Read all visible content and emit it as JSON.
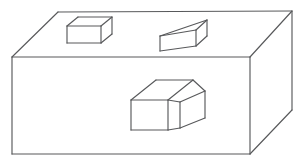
{
  "figure": {
    "background_color": "#ffffff",
    "line_color": "#58595b",
    "fill_color": "#ffffff",
    "line_width": 1.15,
    "projection": "oblique",
    "canvas": {
      "width": 304,
      "height": 163
    }
  },
  "objects": [
    {
      "id": "base-slab",
      "name": "base-slab",
      "label": "Large rectangular slab",
      "role": "ground-block",
      "vertices": {
        "top_back_left": [
          58,
          12
        ],
        "top_back_right": [
          292,
          11
        ],
        "top_front_left": [
          12,
          57
        ],
        "top_front_right": [
          250,
          57
        ],
        "bottom_front_left": [
          12,
          154
        ],
        "bottom_front_right": [
          250,
          154
        ],
        "bottom_back_right": [
          292,
          110
        ]
      }
    },
    {
      "id": "small-block-left",
      "name": "small-block-left",
      "label": "Small block (back left)",
      "role": "raised-block",
      "vertices": {
        "front_top_left": [
          67,
          26
        ],
        "front_top_right": [
          101,
          26
        ],
        "front_bottom_left": [
          67,
          43
        ],
        "front_bottom_right": [
          101,
          43
        ],
        "back_top_left": [
          78,
          17
        ],
        "back_top_right": [
          112,
          17
        ],
        "back_bottom_right": [
          112,
          34
        ]
      }
    },
    {
      "id": "wedge-block-right",
      "name": "wedge-block-right",
      "label": "Wedge block (back right)",
      "role": "raised-block",
      "vertices": {
        "front_top_left": [
          160,
          36
        ],
        "front_top_right": [
          196,
          30
        ],
        "front_bottom_left": [
          160,
          51
        ],
        "front_bottom_right": [
          196,
          46
        ],
        "apex_back_right": [
          207,
          20
        ],
        "back_bottom_right": [
          207,
          36
        ]
      }
    },
    {
      "id": "stepped-block-center",
      "name": "stepped-block-center",
      "label": "Stepped L-shaped block (front center)",
      "role": "raised-block",
      "vertices": {
        "front_top_left": [
          131,
          100
        ],
        "front_top_right": [
          168,
          100
        ],
        "front_bottom_left": [
          131,
          130
        ],
        "front_bottom_right": [
          168,
          130
        ],
        "upper_back_left": [
          156,
          80
        ],
        "upper_back_right": [
          193,
          80
        ],
        "step_inner_top": [
          168,
          91
        ],
        "step_right_top": [
          205,
          91
        ],
        "step_right_front_top": [
          180,
          102
        ],
        "step_right_front_bottom": [
          180,
          128
        ],
        "step_right_back_bottom": [
          205,
          118
        ],
        "low_bottom_inner": [
          168,
          130
        ]
      }
    }
  ],
  "annotations": {
    "has_text_labels": false,
    "has_axes": false,
    "has_legend": false,
    "caption": ""
  }
}
